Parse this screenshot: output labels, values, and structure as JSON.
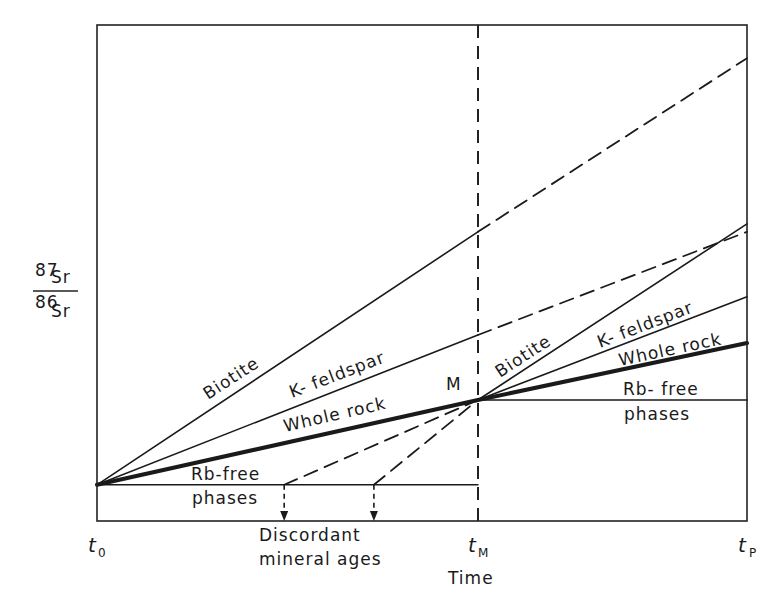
{
  "chart_data": {
    "type": "line",
    "title": "",
    "ylabel": {
      "sup_top": "87",
      "el_top": "Sr",
      "sup_bottom": "86",
      "el_bottom": "Sr"
    },
    "xlabel": "Time",
    "x_ticks": [
      {
        "main": "t",
        "sub": "0"
      },
      {
        "main": "t",
        "sub": "M"
      },
      {
        "main": "t",
        "sub": "P"
      }
    ],
    "x_positions": {
      "t0": 0,
      "tM": 0.586,
      "tP": 1.0
    },
    "y_range": [
      0,
      1
    ],
    "point_label": "M",
    "series": [
      {
        "name": "Biotite",
        "style": "solid",
        "points": [
          [
            0,
            0.073
          ],
          [
            0.586,
            0.583
          ]
        ]
      },
      {
        "name": "Biotite (undisturbed)",
        "style": "dashed",
        "points": [
          [
            0.586,
            0.583
          ],
          [
            1.0,
            0.933
          ]
        ]
      },
      {
        "name": "K-feldspar",
        "style": "solid",
        "points": [
          [
            0,
            0.073
          ],
          [
            0.586,
            0.375
          ]
        ]
      },
      {
        "name": "K-feldspar (undisturbed)",
        "style": "dashed",
        "points": [
          [
            0.586,
            0.375
          ],
          [
            1.0,
            0.583
          ]
        ]
      },
      {
        "name": "Whole rock",
        "style": "thick",
        "points": [
          [
            0,
            0.073
          ],
          [
            0.586,
            0.244
          ],
          [
            1.0,
            0.359
          ]
        ]
      },
      {
        "name": "Rb-free phases",
        "style": "solid",
        "points": [
          [
            0,
            0.073
          ],
          [
            0.586,
            0.073
          ]
        ]
      },
      {
        "name": "Biotite (post-M)",
        "style": "solid",
        "points": [
          [
            0.586,
            0.244
          ],
          [
            1.0,
            0.599
          ]
        ]
      },
      {
        "name": "K-feldspar (post-M)",
        "style": "solid",
        "points": [
          [
            0.586,
            0.244
          ],
          [
            1.0,
            0.452
          ]
        ]
      },
      {
        "name": "Rb-free phases (post-M)",
        "style": "solid",
        "points": [
          [
            0.586,
            0.244
          ],
          [
            1.0,
            0.244
          ]
        ]
      },
      {
        "name": "Discordant age 1",
        "style": "dashed",
        "points": [
          [
            0.288,
            0.073
          ],
          [
            0.586,
            0.244
          ]
        ]
      },
      {
        "name": "Discordant age 2",
        "style": "dashed",
        "points": [
          [
            0.426,
            0.073
          ],
          [
            0.586,
            0.244
          ]
        ]
      }
    ],
    "arrows": [
      {
        "name": "discordant-age-arrow-1",
        "x": 0.288
      },
      {
        "name": "discordant-age-arrow-2",
        "x": 0.426
      }
    ],
    "annotations": {
      "biotite_pre": "Biotite",
      "kfeldspar_pre": "K- feldspar",
      "wholerock_pre": "Whole rock",
      "rbfree_pre_1": "Rb-free",
      "rbfree_pre_2": "phases",
      "biotite_post": "Biotite",
      "kfeldspar_post": "K- feldspar",
      "wholerock_post": "Whole rock",
      "rbfree_post_1": "Rb- free",
      "rbfree_post_2": "phases",
      "discordant_1": "Discordant",
      "discordant_2": "mineral ages"
    }
  }
}
